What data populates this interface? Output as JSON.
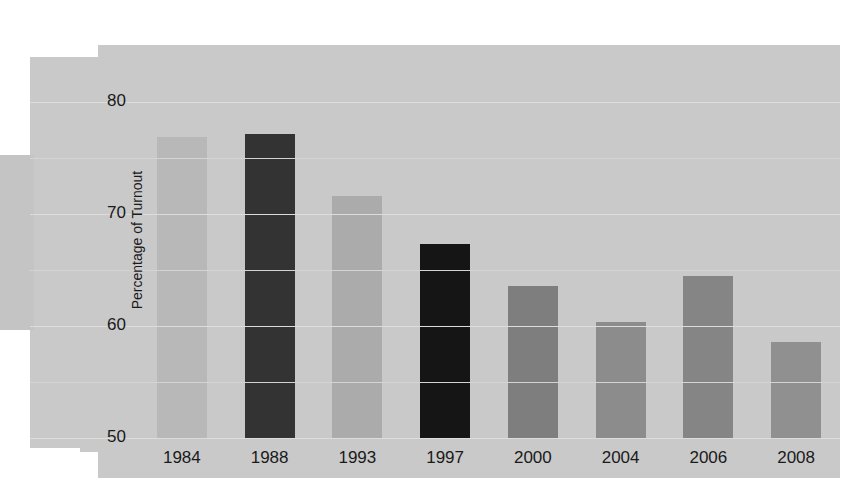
{
  "chart_data": {
    "type": "bar",
    "title": "",
    "xlabel": "",
    "ylabel": "Percentage of Turnout",
    "categories": [
      "1984",
      "1988",
      "1993",
      "1997",
      "2000",
      "2004",
      "2006",
      "2008"
    ],
    "values": [
      76.9,
      77.1,
      71.6,
      67.3,
      63.6,
      60.4,
      64.5,
      58.6
    ],
    "bar_colors": [
      "#b8b8b8",
      "#333333",
      "#ababab",
      "#151515",
      "#7e7e7e",
      "#8c8c8c",
      "#858585",
      "#909090"
    ],
    "ylim": [
      50,
      80
    ],
    "yticks": [
      50,
      60,
      70,
      80
    ],
    "ytick_labels": [
      "50",
      "60",
      "70",
      "80"
    ],
    "minor_gridlines": [
      55,
      65,
      75
    ],
    "grid": true,
    "legend": "none",
    "background_color": "#c9c9c9",
    "gridline_color": "#dcdcdc",
    "text_color": "#1a1a1a"
  },
  "axis": {
    "y_title": "Percentage of Turnout",
    "y_ticks": [
      "80",
      "70",
      "60",
      "50"
    ],
    "x_ticks": [
      "1984",
      "1988",
      "1993",
      "1997",
      "2000",
      "2004",
      "2006",
      "2008"
    ]
  }
}
